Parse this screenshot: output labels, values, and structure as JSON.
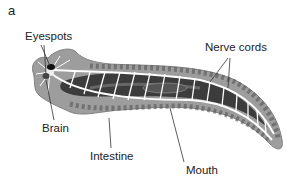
{
  "panel_label": "a",
  "figure": {
    "labels": {
      "eyespots": "Eyespots",
      "nerve_cords": "Nerve cords",
      "brain": "Brain",
      "intestine": "Intestine",
      "mouth": "Mouth"
    },
    "colors": {
      "body": "#9a9a9a",
      "body_edge": "#7a7a7a",
      "intestine": "#3a3a3a",
      "nerve": "#ffffff",
      "text": "#222222",
      "leader_line": "#333333"
    }
  }
}
